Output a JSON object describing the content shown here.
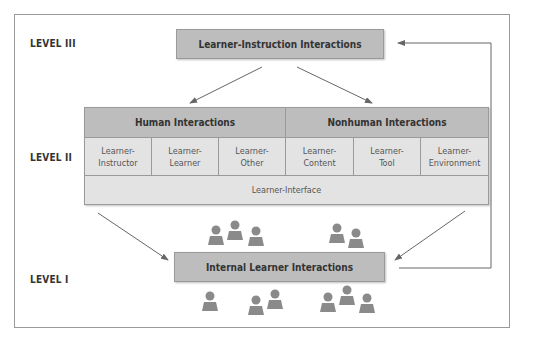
{
  "levels": {
    "level3": "LEVEL III",
    "level2": "LEVEL II",
    "level1": "LEVEL I"
  },
  "top_box": "Learner-Instruction Interactions",
  "bottom_box": "Internal Learner Interactions",
  "grid": {
    "human_header": "Human Interactions",
    "nonhuman_header": "Nonhuman Interactions",
    "cells": [
      {
        "line1": "Learner-",
        "line2": "Instructor"
      },
      {
        "line1": "Learner-",
        "line2": "Learner"
      },
      {
        "line1": "Learner-",
        "line2": "Other"
      },
      {
        "line1": "Learner-",
        "line2": "Content"
      },
      {
        "line1": "Learner-",
        "line2": "Tool"
      },
      {
        "line1": "Learner-",
        "line2": "Environment"
      }
    ],
    "interface": "Learner-Interface"
  },
  "colors": {
    "box_fill": "#bdbdbd",
    "cell_fill": "#e3e3e3",
    "border": "#9a9a9a",
    "person": "#8a8a8a",
    "arrow": "#666666"
  }
}
